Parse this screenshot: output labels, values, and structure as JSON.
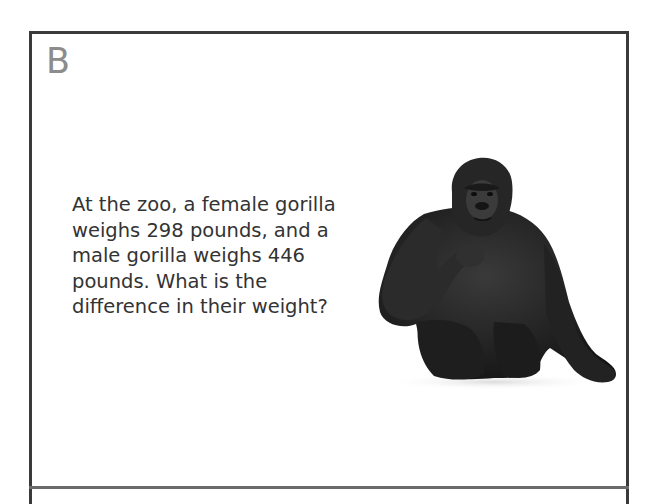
{
  "card": {
    "label": "B",
    "problem_lines": [
      "At the zoo, a female gorilla",
      "weighs 298 pounds, and a",
      "male gorilla weighs 446",
      "pounds. What is the",
      "difference in their weight?"
    ],
    "image": {
      "subject": "gorilla-illustration"
    }
  },
  "colors": {
    "border": "#3a3a3a",
    "label": "#8c8c8c",
    "text": "#333333",
    "gorilla": "#1f1f1f"
  }
}
